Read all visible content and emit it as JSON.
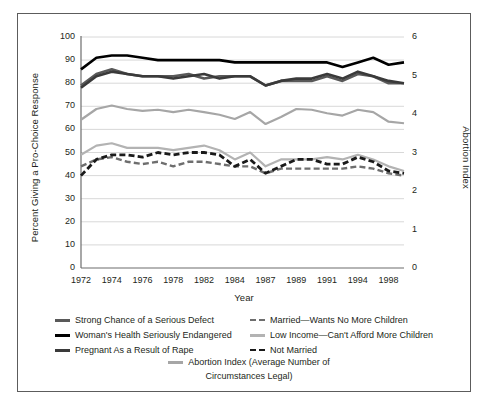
{
  "figure": {
    "background": "#ffffff",
    "frame_color": "#5c5c5c"
  },
  "chart_data": {
    "type": "line",
    "title": "",
    "xlabel": "Year",
    "ylabel": "Percent Giving a Pro-Choice Response",
    "ylabel_right": "Abortion Index",
    "ylim": [
      0,
      100
    ],
    "yticks": [
      0,
      10,
      20,
      30,
      40,
      50,
      60,
      70,
      80,
      90,
      100
    ],
    "ylim_right": [
      0,
      6
    ],
    "yticks_right": [
      0,
      1,
      2,
      3,
      4,
      5,
      6
    ],
    "grid": "horizontal",
    "legend_position": "below",
    "categories": [
      "1972",
      "1973",
      "1974",
      "1975",
      "1976",
      "1977",
      "1978",
      "1980",
      "1982",
      "1983",
      "1984",
      "1985",
      "1987",
      "1988",
      "1989",
      "1990",
      "1991",
      "1993",
      "1994",
      "1996",
      "1998",
      "2000"
    ],
    "xticks": [
      "1972",
      "1974",
      "1976",
      "1978",
      "1982",
      "1984",
      "1987",
      "1989",
      "1991",
      "1994",
      "1998"
    ],
    "xtick_positions": [
      0,
      2,
      4,
      6,
      8,
      10,
      12,
      14,
      16,
      18,
      20
    ],
    "series": [
      {
        "name": "Woman's Health Seriously Endangered",
        "color": "#000000",
        "style": "solid",
        "width": 2.6,
        "axis": "left",
        "values": [
          86,
          91,
          92,
          92,
          91,
          90,
          90,
          90,
          90,
          90,
          89,
          89,
          89,
          89,
          89,
          89,
          89,
          87,
          89,
          91,
          88,
          89
        ]
      },
      {
        "name": "Strong Chance of a Serious Defect",
        "color": "#595959",
        "style": "solid",
        "width": 2.6,
        "axis": "left",
        "values": [
          79,
          84,
          86,
          84,
          83,
          83,
          83,
          84,
          82,
          83,
          83,
          83,
          79,
          81,
          81,
          81,
          83,
          81,
          84,
          83,
          80,
          80
        ]
      },
      {
        "name": "Pregnant As a Result of Rape",
        "color": "#3a3a3a",
        "style": "solid",
        "width": 2.6,
        "axis": "left",
        "values": [
          78,
          83,
          85,
          84,
          83,
          83,
          82,
          83,
          84,
          82,
          83,
          83,
          79,
          81,
          82,
          82,
          84,
          82,
          85,
          83,
          81,
          80
        ]
      },
      {
        "name": "Low Income—Can't Afford More Children",
        "color": "#b3b3b3",
        "style": "solid",
        "width": 2.2,
        "axis": "left",
        "values": [
          49,
          53,
          54,
          52,
          52,
          52,
          51,
          52,
          53,
          51,
          47,
          50,
          44,
          47,
          47,
          47,
          48,
          47,
          49,
          47,
          44,
          42
        ]
      },
      {
        "name": "Married—Wants No More Children",
        "color": "#6e6e6e",
        "style": "dashed",
        "width": 2.4,
        "axis": "left",
        "values": [
          44,
          47,
          48,
          46,
          45,
          46,
          44,
          46,
          46,
          45,
          44,
          44,
          41,
          43,
          43,
          43,
          43,
          43,
          44,
          43,
          41,
          40
        ]
      },
      {
        "name": "Not Married",
        "color": "#1a1a1a",
        "style": "dashed",
        "width": 2.8,
        "axis": "left",
        "values": [
          40,
          47,
          49,
          49,
          48,
          50,
          49,
          50,
          50,
          49,
          44,
          47,
          41,
          44,
          47,
          47,
          45,
          45,
          48,
          46,
          42,
          41
        ]
      },
      {
        "name": "Abortion Index (Average Number of Circumstances Legal)",
        "color": "#a6a6a6",
        "style": "solid",
        "width": 2.2,
        "axis": "right",
        "values": [
          3.85,
          4.13,
          4.22,
          4.13,
          4.08,
          4.11,
          4.05,
          4.11,
          4.05,
          3.98,
          3.87,
          4.05,
          3.74,
          3.92,
          4.13,
          4.11,
          4.02,
          3.96,
          4.11,
          4.05,
          3.8,
          3.76
        ]
      }
    ]
  },
  "axes": {
    "y_left_title": "Percent Giving a Pro-Choice Response",
    "y_right_title": "Abortion Index",
    "x_title": "Year"
  },
  "legend": {
    "left_column": [
      {
        "label": "Strong Chance of a Serious Defect",
        "color": "#595959",
        "style": "solid"
      },
      {
        "label": "Woman's Health Seriously Endangered",
        "color": "#000000",
        "style": "solid"
      },
      {
        "label": "Pregnant As a Result of Rape",
        "color": "#3a3a3a",
        "style": "solid"
      }
    ],
    "right_column": [
      {
        "label": "Married—Wants No More Children",
        "color": "#6e6e6e",
        "style": "dashed"
      },
      {
        "label": "Low Income—Can't Afford More Children",
        "color": "#b3b3b3",
        "style": "solid"
      },
      {
        "label": "Not Married",
        "color": "#1a1a1a",
        "style": "dashed"
      }
    ],
    "centered": {
      "label": "Abortion Index (Average Number of",
      "label2": "Circumstances Legal)",
      "color": "#a6a6a6",
      "style": "solid"
    }
  }
}
